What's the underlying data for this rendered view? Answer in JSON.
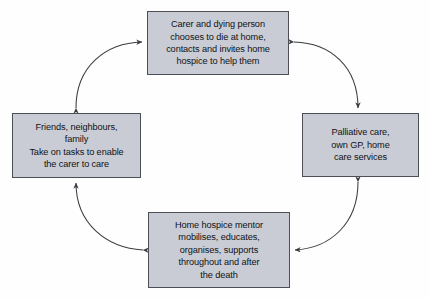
{
  "diagram": {
    "type": "cycle-diagram",
    "background_color": "#fefefe",
    "node_fill_color": "#c9ccd4",
    "node_border_color": "#4c4f55",
    "arrow_color": "#3a3c41",
    "nodes": [
      {
        "id": "top",
        "position": "top",
        "text": "Carer and dying person\nchooses to die at home,\ncontacts and invites home\nhospice to help them"
      },
      {
        "id": "right",
        "position": "right",
        "text": "Palliative care,\nown GP, home\ncare services"
      },
      {
        "id": "bottom",
        "position": "bottom",
        "text": "Home hospice mentor\nmobilises, educates,\norganises, supports\nthroughout and after\nthe death"
      },
      {
        "id": "left",
        "position": "left",
        "text": "Friends, neighbours,\nfamily\nTake on tasks to enable\nthe carer to care"
      }
    ],
    "connectors": [
      {
        "id": "top-left-arc",
        "from": "left",
        "to": "top",
        "style": "curved",
        "arrowheads": "both"
      },
      {
        "id": "top-right-arc",
        "from": "top",
        "to": "right",
        "style": "curved",
        "arrowheads": "both"
      },
      {
        "id": "bottom-right-arc",
        "from": "right",
        "to": "bottom",
        "style": "curved",
        "arrowheads": "both"
      },
      {
        "id": "bottom-left-arc",
        "from": "bottom",
        "to": "left",
        "style": "curved",
        "arrowheads": "both"
      }
    ]
  }
}
